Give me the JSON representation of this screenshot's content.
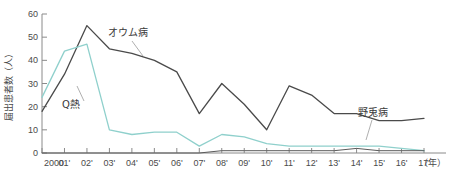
{
  "chart_data": {
    "type": "line",
    "title": "",
    "xlabel": "（年）",
    "ylabel": "届出患者数（人）",
    "ylim": [
      0,
      60
    ],
    "yticks": [
      0,
      10,
      20,
      30,
      40,
      50,
      60
    ],
    "grid": false,
    "legend_position": "inline-annotations",
    "categories": [
      "2000",
      "01'",
      "02'",
      "03'",
      "04'",
      "05'",
      "06'",
      "07'",
      "08'",
      "09'",
      "10'",
      "11'",
      "12'",
      "13'",
      "14'",
      "15'",
      "16'",
      "17'"
    ],
    "x": [
      2000,
      2001,
      2002,
      2003,
      2004,
      2005,
      2006,
      2007,
      2008,
      2009,
      2010,
      2011,
      2012,
      2013,
      2014,
      2015,
      2016,
      2017
    ],
    "series": [
      {
        "name": "オウム病",
        "color": "#4a4a4a",
        "values": [
          18,
          34,
          55,
          45,
          43,
          40,
          35,
          17,
          30,
          21,
          10,
          29,
          25,
          17,
          17,
          14,
          14,
          15
        ]
      },
      {
        "name": "Q熱",
        "color": "#8fd0cc",
        "values": [
          24,
          44,
          47,
          10,
          8,
          9,
          9,
          3,
          8,
          7,
          4,
          3,
          3,
          3,
          3,
          3,
          2,
          1
        ]
      },
      {
        "name": "野兎病",
        "color": "#5a5a5a",
        "values": [
          0,
          0,
          0,
          0,
          0,
          0,
          0,
          0,
          1,
          1,
          1,
          1,
          1,
          1,
          2,
          1,
          1,
          1
        ]
      }
    ],
    "annotations": [
      {
        "label": "オウム病",
        "x_px": 108,
        "y_px": 36
      },
      {
        "label": "Q熱",
        "x_px": 62,
        "y_px": 106
      },
      {
        "label": "野兎病",
        "x_px": 358,
        "y_px": 116
      }
    ]
  },
  "axis": {
    "y_tick_labels": [
      "60",
      "50",
      "40",
      "30",
      "20",
      "10",
      "0"
    ],
    "y_title": "届出患者数（人）",
    "x_tick_labels": [
      "2000",
      "01'",
      "02'",
      "03'",
      "04'",
      "05'",
      "06'",
      "07'",
      "08'",
      "09'",
      "10'",
      "11'",
      "12'",
      "13'",
      "14'",
      "15'",
      "16'",
      "17'"
    ],
    "x_unit_label": "（年）"
  },
  "labels": {
    "series_psittacosis": "オウム病",
    "series_qfever": "Q熱",
    "series_tularemia": "野兎病"
  }
}
